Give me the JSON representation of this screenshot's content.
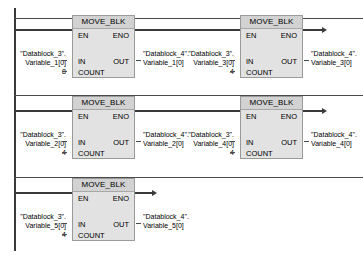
{
  "editor": {
    "language": "LAD",
    "block_type": "MOVE_BLK",
    "rail_color": "#3a3a3a",
    "block_fill": "#e2e2e2",
    "block_header_fill": "#d2d2d2",
    "block_border": "#9a9a9a"
  },
  "pins": {
    "en": "EN",
    "eno": "ENO",
    "in": "IN",
    "out": "OUT",
    "count": "COUNT"
  },
  "networks": [
    {
      "id": "rung-1",
      "blocks": [
        {
          "id": "block-1-1",
          "title": "MOVE_BLK",
          "in_operand_line1": "\"Datablock_3\".",
          "in_operand_line2": "Variable_1[0]",
          "count_value": "8",
          "out_operand_line1": "\"Datablock_4\".",
          "out_operand_line2": "Variable_1[0]"
        },
        {
          "id": "block-1-2",
          "title": "MOVE_BLK",
          "in_operand_line1": "\"Datablock_3\".",
          "in_operand_line2": "Variable_3[0]",
          "count_value": "4",
          "out_operand_line1": "\"Datablock_4\".",
          "out_operand_line2": "Variable_3[0]"
        }
      ]
    },
    {
      "id": "rung-2",
      "blocks": [
        {
          "id": "block-2-1",
          "title": "MOVE_BLK",
          "in_operand_line1": "\"Datablock_3\".",
          "in_operand_line2": "Variable_2[0]",
          "count_value": "4",
          "out_operand_line1": "\"Datablock_4\".",
          "out_operand_line2": "Variable_2[0]"
        },
        {
          "id": "block-2-2",
          "title": "MOVE_BLK",
          "in_operand_line1": "\"Datablock_3\".",
          "in_operand_line2": "Variable_4[0]",
          "count_value": "4",
          "out_operand_line1": "\"Datablock_4\".",
          "out_operand_line2": "Variable_4[0]"
        }
      ]
    },
    {
      "id": "rung-3",
      "blocks": [
        {
          "id": "block-3-1",
          "title": "MOVE_BLK",
          "in_operand_line1": "\"Datablock_3\".",
          "in_operand_line2": "Variable_5[0]",
          "count_value": "4",
          "out_operand_line1": "\"Datablock_4\".",
          "out_operand_line2": "Variable_5[0]"
        }
      ]
    }
  ]
}
